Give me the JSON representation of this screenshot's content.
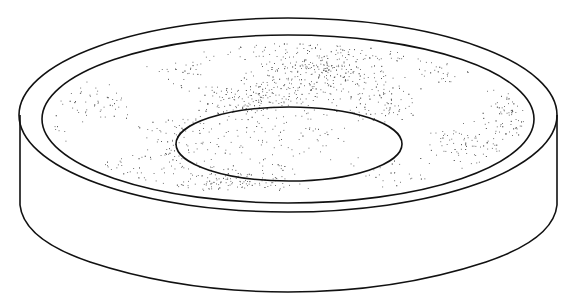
{
  "figure": {
    "subject": "circular dish-shaped pad with raised outer rim, stippled annular surface and central recessed disc",
    "style": "black line drawing with stipple shading on white background",
    "colors": {
      "background": "#ffffff",
      "line": "#111111",
      "stipple": "#555555"
    },
    "parts": [
      {
        "name": "outer-rim",
        "shape": "ellipse",
        "cx": 288,
        "cy": 115,
        "rx": 269,
        "ry": 97
      },
      {
        "name": "inner-rim",
        "shape": "ellipse",
        "cx": 288,
        "cy": 119,
        "rx": 246,
        "ry": 84
      },
      {
        "name": "center-disc",
        "shape": "ellipse",
        "cx": 289,
        "cy": 144,
        "rx": 113,
        "ry": 37
      },
      {
        "name": "side-wall",
        "shape": "cylinder-wall",
        "left_x": 20,
        "right_x": 557,
        "top_y": 115,
        "bottom_y": 292
      }
    ]
  }
}
